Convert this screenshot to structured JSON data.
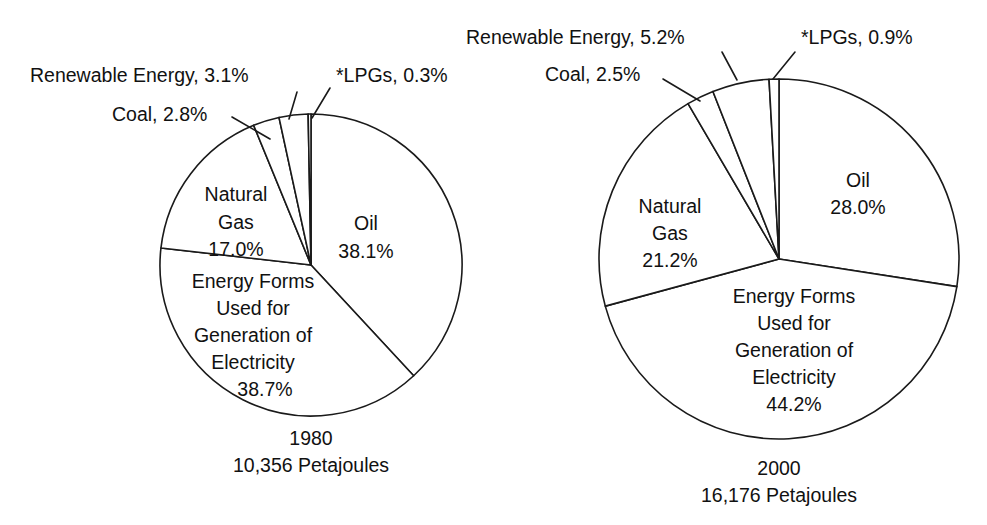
{
  "chart_data": [
    {
      "type": "pie",
      "title": "1980",
      "subtitle": "10,356 Petajoules",
      "total_label": "10,356 Petajoules",
      "units": "Petajoules",
      "total_value": 10356,
      "categories": [
        "Oil",
        "Energy Forms Used for Generation of Electricity",
        "Natural Gas",
        "Coal",
        "Renewable Energy",
        "*LPGs"
      ],
      "values": [
        38.1,
        38.7,
        17.0,
        2.8,
        3.1,
        0.3
      ],
      "value_labels": [
        "38.1%",
        "38.7%",
        "17.0%",
        "2.8%",
        "3.1%",
        "0.3%"
      ],
      "label_placement": [
        "inside",
        "inside",
        "inside",
        "callout",
        "callout",
        "callout"
      ],
      "geometry": {
        "cx": 311,
        "cy": 265,
        "r": 151,
        "start_angle_deg": -90
      },
      "legend": "none",
      "grid": false
    },
    {
      "type": "pie",
      "title": "2000",
      "subtitle": "16,176 Petajoules",
      "total_label": "16,176 Petajoules",
      "units": "Petajoules",
      "total_value": 16176,
      "categories": [
        "Oil",
        "Energy Forms Used for Generation of Electricity",
        "Natural Gas",
        "Coal",
        "Renewable Energy",
        "*LPGs"
      ],
      "values": [
        28.0,
        44.2,
        21.2,
        2.5,
        5.2,
        0.9
      ],
      "value_labels": [
        "28.0%",
        "44.2%",
        "21.2%",
        "2.5%",
        "5.2%",
        "0.9%"
      ],
      "label_placement": [
        "inside",
        "inside",
        "inside",
        "callout",
        "callout",
        "callout"
      ],
      "geometry": {
        "cx": 779,
        "cy": 259,
        "r": 180,
        "start_angle_deg": -90
      },
      "legend": "none",
      "grid": false
    }
  ],
  "left_chart": {
    "callouts": {
      "renewable": "Renewable Energy, 3.1%",
      "coal": "Coal, 2.8%",
      "lpgs": "*LPGs, 0.3%"
    },
    "inner": {
      "natural_gas_line1": "Natural",
      "natural_gas_line2": "Gas",
      "natural_gas_value": "17.0%",
      "oil_line1": "Oil",
      "oil_value": "38.1%",
      "electricity_line1": "Energy Forms",
      "electricity_line2": "Used for",
      "electricity_line3": "Generation of",
      "electricity_line4": "Electricity",
      "electricity_value": "38.7%"
    },
    "caption_year": "1980",
    "caption_total": "10,356 Petajoules"
  },
  "right_chart": {
    "callouts": {
      "renewable": "Renewable Energy, 5.2%",
      "coal": "Coal, 2.5%",
      "lpgs": "*LPGs, 0.9%"
    },
    "inner": {
      "natural_gas_line1": "Natural",
      "natural_gas_line2": "Gas",
      "natural_gas_value": "21.2%",
      "oil_line1": "Oil",
      "oil_value": "28.0%",
      "electricity_line1": "Energy Forms",
      "electricity_line2": "Used for",
      "electricity_line3": "Generation of",
      "electricity_line4": "Electricity",
      "electricity_value": "44.2%"
    },
    "caption_year": "2000",
    "caption_total": "16,176 Petajoules"
  },
  "colors": {
    "background": "#ffffff",
    "slice_fill": "#ffffff",
    "stroke": "#1a1a1a",
    "text": "#111111"
  }
}
